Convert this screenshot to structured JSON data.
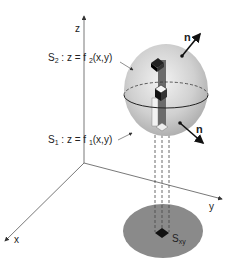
{
  "diagram": {
    "axes": {
      "z": "z",
      "y": "y",
      "x": "x"
    },
    "surfaces": {
      "upper": {
        "name": "S",
        "sub": "2",
        "eq_prefix": " : z = f ",
        "eq_sub": "2",
        "eq_suffix": "(x,y)"
      },
      "lower": {
        "name": "S",
        "sub": "1",
        "eq_prefix": " : z = f ",
        "eq_sub": "1",
        "eq_suffix": "(x,y)"
      }
    },
    "normals": {
      "upper": "n",
      "lower": "n"
    },
    "projection": {
      "name": "S",
      "sub": "xy"
    },
    "colors": {
      "surface": "#c8c8c8",
      "projection": "#8a8a8a",
      "ink": "#222222"
    }
  }
}
